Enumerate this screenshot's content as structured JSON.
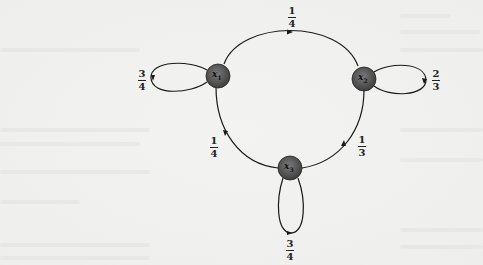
{
  "diagram": {
    "type": "markov-chain-state-diagram",
    "nodes": [
      {
        "id": "x1",
        "label": "x",
        "sub": "1"
      },
      {
        "id": "x2",
        "label": "x",
        "sub": "2"
      },
      {
        "id": "x3",
        "label": "x",
        "sub": "3"
      }
    ],
    "edges": [
      {
        "from": "x1",
        "to": "x2",
        "prob_num": "1",
        "prob_den": "4"
      },
      {
        "from": "x1",
        "to": "x1",
        "prob_num": "3",
        "prob_den": "4"
      },
      {
        "from": "x2",
        "to": "x2",
        "prob_num": "2",
        "prob_den": "3"
      },
      {
        "from": "x2",
        "to": "x3",
        "prob_num": "1",
        "prob_den": "3"
      },
      {
        "from": "x3",
        "to": "x1",
        "prob_num": "1",
        "prob_den": "4"
      },
      {
        "from": "x3",
        "to": "x3",
        "prob_num": "3",
        "prob_den": "4"
      }
    ],
    "colors": {
      "node_fill": "#5a5a5a",
      "edge": "#1a1a1a",
      "background": "#f1f1ef"
    }
  }
}
